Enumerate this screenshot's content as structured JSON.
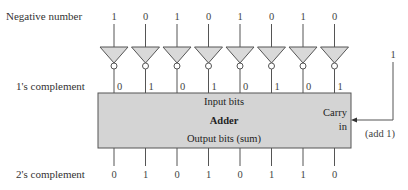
{
  "labels": {
    "negative_number": "Negative number",
    "ones_complement": "1's complement",
    "twos_complement": "2's complement"
  },
  "adder": {
    "title": "Adder",
    "input_label": "Input bits",
    "output_label": "Output bits (sum)",
    "carry_label_1": "Carry",
    "carry_label_2": "in",
    "carry_value": "1",
    "add_note": "(add 1)"
  },
  "bits": {
    "negative": [
      "1",
      "0",
      "1",
      "0",
      "1",
      "0",
      "1",
      "0"
    ],
    "ones_complement": [
      "0",
      "1",
      "0",
      "1",
      "0",
      "1",
      "0",
      "1"
    ],
    "twos_complement": [
      "0",
      "1",
      "0",
      "1",
      "0",
      "1",
      "1",
      "0"
    ]
  },
  "colors": {
    "gate_fill": "#d9d9d9",
    "box_fill": "#d4d4d4",
    "stroke": "#555555"
  }
}
